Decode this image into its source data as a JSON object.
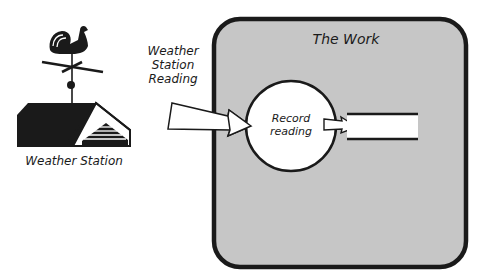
{
  "diagram": {
    "work_box": {
      "title": "The Work",
      "fill": "#c6c6c6",
      "border": "#1a1a1a"
    },
    "external": {
      "label": "Weather Station",
      "icon": "weather-vane-building-icon"
    },
    "flow_in": {
      "label_lines": [
        "Weather",
        "Station",
        "Reading"
      ]
    },
    "process": {
      "label_lines": [
        "Record",
        "reading"
      ]
    },
    "data_store": {
      "label": ""
    }
  }
}
